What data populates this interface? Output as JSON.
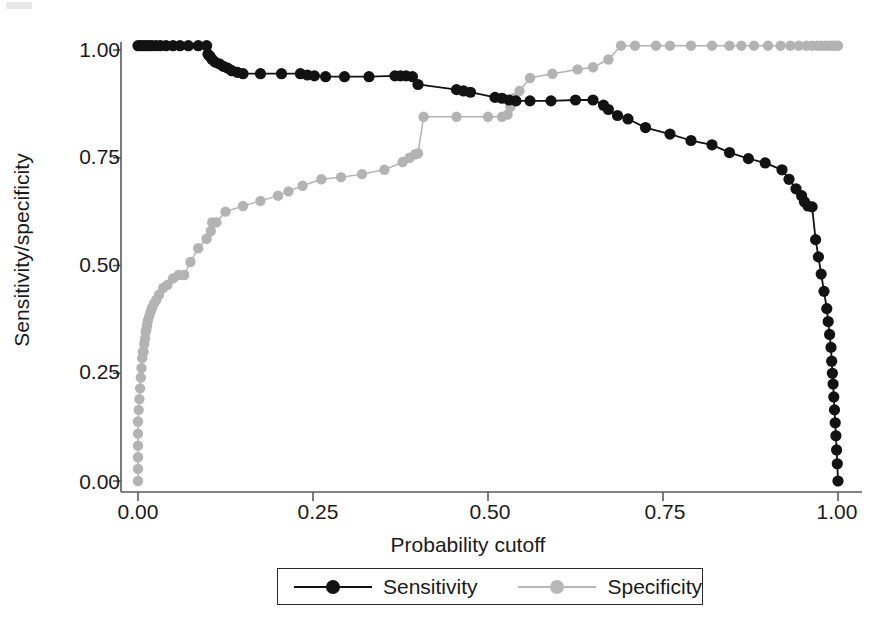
{
  "chart_data": {
    "type": "line",
    "title": "",
    "xlabel": "Probability cutoff",
    "ylabel": "Sensitivity/specificity",
    "xlim": [
      -0.02,
      1.02
    ],
    "ylim": [
      -0.02,
      1.04
    ],
    "grid": false,
    "xticks": [
      0.0,
      0.25,
      0.5,
      0.75,
      1.0
    ],
    "xticklabels": [
      "0.00",
      "0.25",
      "0.50",
      "0.75",
      "1.00"
    ],
    "yticks": [
      0.0,
      0.25,
      0.5,
      0.75,
      1.0
    ],
    "yticklabels": [
      "0.00",
      "0.25",
      "0.50",
      "0.75",
      "1.00"
    ],
    "legend_position": "bottom-center",
    "series": [
      {
        "name": "Sensitivity",
        "color": "#121212",
        "marker": "circle",
        "x": [
          0.0,
          0.004,
          0.008,
          0.012,
          0.016,
          0.02,
          0.026,
          0.032,
          0.04,
          0.05,
          0.06,
          0.072,
          0.086,
          0.098,
          0.1,
          0.103,
          0.106,
          0.11,
          0.116,
          0.122,
          0.128,
          0.134,
          0.142,
          0.15,
          0.175,
          0.205,
          0.232,
          0.242,
          0.252,
          0.268,
          0.295,
          0.33,
          0.367,
          0.375,
          0.383,
          0.392,
          0.4,
          0.455,
          0.465,
          0.475,
          0.51,
          0.52,
          0.53,
          0.54,
          0.56,
          0.59,
          0.625,
          0.65,
          0.665,
          0.672,
          0.685,
          0.7,
          0.725,
          0.76,
          0.79,
          0.82,
          0.845,
          0.872,
          0.896,
          0.92,
          0.93,
          0.94,
          0.948,
          0.952,
          0.957,
          0.963,
          0.968,
          0.972,
          0.976,
          0.98,
          0.984,
          0.986,
          0.988,
          0.99,
          0.991,
          0.992,
          0.993,
          0.994,
          0.995,
          0.996,
          0.997,
          0.998,
          0.999,
          1.0
        ],
        "y": [
          1.01,
          1.01,
          1.01,
          1.01,
          1.01,
          1.01,
          1.01,
          1.01,
          1.01,
          1.01,
          1.01,
          1.01,
          1.01,
          1.01,
          0.99,
          0.985,
          0.978,
          0.972,
          0.968,
          0.962,
          0.958,
          0.952,
          0.948,
          0.945,
          0.945,
          0.945,
          0.945,
          0.942,
          0.94,
          0.938,
          0.938,
          0.938,
          0.94,
          0.94,
          0.94,
          0.938,
          0.92,
          0.908,
          0.905,
          0.902,
          0.89,
          0.888,
          0.884,
          0.882,
          0.882,
          0.882,
          0.884,
          0.884,
          0.872,
          0.862,
          0.848,
          0.84,
          0.82,
          0.805,
          0.79,
          0.78,
          0.762,
          0.748,
          0.738,
          0.722,
          0.7,
          0.678,
          0.662,
          0.648,
          0.638,
          0.636,
          0.56,
          0.52,
          0.48,
          0.44,
          0.4,
          0.37,
          0.34,
          0.31,
          0.278,
          0.25,
          0.225,
          0.195,
          0.165,
          0.135,
          0.105,
          0.072,
          0.04,
          0.0
        ]
      },
      {
        "name": "Specificity",
        "color": "#b3b3b3",
        "marker": "circle",
        "x": [
          0.0,
          0.0,
          0.0,
          0.0,
          0.0,
          0.0,
          0.001,
          0.002,
          0.003,
          0.004,
          0.005,
          0.006,
          0.007,
          0.008,
          0.009,
          0.01,
          0.011,
          0.012,
          0.013,
          0.014,
          0.016,
          0.018,
          0.02,
          0.023,
          0.026,
          0.03,
          0.036,
          0.042,
          0.05,
          0.058,
          0.066,
          0.075,
          0.086,
          0.098,
          0.104,
          0.106,
          0.112,
          0.125,
          0.15,
          0.175,
          0.2,
          0.215,
          0.235,
          0.262,
          0.29,
          0.32,
          0.352,
          0.378,
          0.388,
          0.396,
          0.4,
          0.408,
          0.455,
          0.5,
          0.52,
          0.528,
          0.532,
          0.536,
          0.545,
          0.56,
          0.592,
          0.628,
          0.65,
          0.672,
          0.69,
          0.71,
          0.74,
          0.76,
          0.79,
          0.82,
          0.845,
          0.862,
          0.88,
          0.9,
          0.918,
          0.932,
          0.944,
          0.955,
          0.963,
          0.97,
          0.976,
          0.982,
          0.988,
          0.993,
          0.997,
          1.0
        ],
        "y": [
          0.0,
          0.028,
          0.055,
          0.082,
          0.11,
          0.138,
          0.165,
          0.19,
          0.215,
          0.24,
          0.262,
          0.285,
          0.3,
          0.3,
          0.318,
          0.33,
          0.345,
          0.352,
          0.362,
          0.372,
          0.382,
          0.392,
          0.402,
          0.412,
          0.42,
          0.432,
          0.448,
          0.455,
          0.47,
          0.478,
          0.478,
          0.508,
          0.54,
          0.562,
          0.58,
          0.6,
          0.6,
          0.625,
          0.638,
          0.65,
          0.662,
          0.672,
          0.685,
          0.7,
          0.705,
          0.712,
          0.722,
          0.74,
          0.75,
          0.758,
          0.76,
          0.845,
          0.845,
          0.845,
          0.845,
          0.85,
          0.868,
          0.888,
          0.905,
          0.935,
          0.945,
          0.955,
          0.96,
          0.978,
          1.01,
          1.01,
          1.01,
          1.01,
          1.01,
          1.01,
          1.01,
          1.01,
          1.01,
          1.01,
          1.01,
          1.01,
          1.01,
          1.01,
          1.01,
          1.01,
          1.01,
          1.01,
          1.01,
          1.01,
          1.01,
          1.01
        ]
      }
    ]
  },
  "axes": {
    "y_title": "Sensitivity/specificity",
    "x_title": "Probability cutoff",
    "y_ticks": [
      "1.00",
      "0.75",
      "0.50",
      "0.25",
      "0.00"
    ],
    "x_ticks": [
      "0.00",
      "0.25",
      "0.50",
      "0.75",
      "1.00"
    ]
  },
  "legend": {
    "items": [
      {
        "label": "Sensitivity",
        "color": "#121212"
      },
      {
        "label": "Specificity",
        "color": "#b3b3b3"
      }
    ]
  }
}
